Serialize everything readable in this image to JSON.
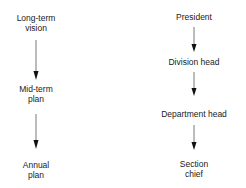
{
  "left_flow": {
    "nodes": [
      {
        "lines": [
          "Long-term",
          "vision"
        ]
      },
      {
        "lines": [
          "Mid-term",
          "plan"
        ]
      },
      {
        "lines": [
          "Annual",
          "plan"
        ]
      }
    ]
  },
  "right_flow": {
    "nodes": [
      {
        "lines": [
          "President"
        ]
      },
      {
        "lines": [
          "Division head"
        ]
      },
      {
        "lines": [
          "Department head"
        ]
      },
      {
        "lines": [
          "Section",
          "chief"
        ]
      }
    ]
  }
}
